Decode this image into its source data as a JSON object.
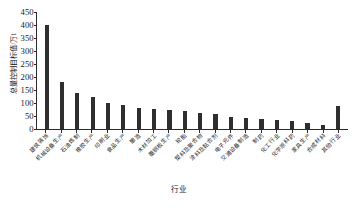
{
  "chart_data": {
    "type": "bar",
    "title": "",
    "xlabel": "行业",
    "ylabel": "总量控制目标值/万t",
    "ylim": [
      0,
      450
    ],
    "ytick_step": 50,
    "yticks": [
      450,
      400,
      350,
      300,
      250,
      200,
      150,
      100,
      50,
      0
    ],
    "grid": false,
    "legend": "none",
    "bar_color": "#2e2e2e",
    "categories": [
      "建筑装饰",
      "机械设备生产",
      "石油炼制",
      "橡胶生产",
      "印刷业",
      "食品生产",
      "酿造",
      "木材加工",
      "覆铜板生产",
      "轮胎",
      "塑料及聚合物",
      "涂料及黏合剂",
      "电子元件",
      "交通设备制造",
      "制药",
      "化工行业",
      "化学原料药",
      "家具生产",
      "合成材料",
      "其他行业"
    ],
    "values": [
      400,
      180,
      140,
      125,
      100,
      92,
      80,
      78,
      75,
      70,
      62,
      58,
      45,
      44,
      38,
      36,
      30,
      24,
      16,
      90
    ]
  },
  "axis": {
    "y_title": "总量控制目标值/万t",
    "x_title": "行业"
  }
}
